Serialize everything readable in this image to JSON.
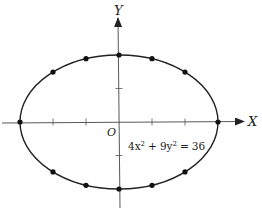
{
  "figure": {
    "type": "ellipse-plot",
    "x_axis_label": "X",
    "y_axis_label": "Y",
    "origin_label": "O",
    "equation": {
      "term1_coef": "4x",
      "term1_exp": "2",
      "plus": "+",
      "term2_coef": "9y",
      "term2_exp": "2",
      "equals": "=",
      "rhs": "36",
      "full_text": "4x² + 9y² = 36"
    },
    "colors": {
      "curve": "#222222",
      "axis": "#333333",
      "dot": "#111111",
      "background": "#ffffff"
    }
  },
  "chart_data": {
    "type": "scatter",
    "title": "",
    "equation": "4x^2 + 9y^2 = 36",
    "semi_major_axis_a": 3,
    "semi_minor_axis_b": 2,
    "xlabel": "X",
    "ylabel": "Y",
    "x_ticks": [
      -2,
      -1,
      1,
      2
    ],
    "y_ticks": [
      -1,
      1
    ],
    "xlim": [
      -3.5,
      3.9
    ],
    "ylim": [
      -2.6,
      3.7
    ],
    "grid": false,
    "points": [
      {
        "x": -3,
        "y": 0
      },
      {
        "x": -2,
        "y": 1.49
      },
      {
        "x": -1,
        "y": 1.89
      },
      {
        "x": 0,
        "y": 2
      },
      {
        "x": 1,
        "y": 1.89
      },
      {
        "x": 2,
        "y": 1.49
      },
      {
        "x": 3,
        "y": 0
      },
      {
        "x": 2,
        "y": -1.49
      },
      {
        "x": 1,
        "y": -1.89
      },
      {
        "x": 0,
        "y": -2
      },
      {
        "x": -1,
        "y": -1.89
      },
      {
        "x": -2,
        "y": -1.49
      }
    ]
  }
}
